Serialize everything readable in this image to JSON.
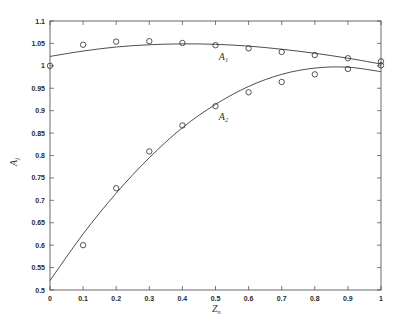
{
  "chart_data": {
    "type": "line",
    "title": "",
    "xlabel": {
      "base": "Z",
      "sub": "n"
    },
    "ylabel": {
      "base": "A",
      "sub": "j"
    },
    "xlim": [
      0,
      1
    ],
    "ylim": [
      0.5,
      1.1
    ],
    "grid": false,
    "legend": null,
    "xticks": [
      0,
      0.1,
      0.2,
      0.3,
      0.4,
      0.5,
      0.6,
      0.7,
      0.8,
      0.9,
      1
    ],
    "xticklabels": [
      "0",
      "0.1",
      "0.2",
      "0.3",
      "0.4",
      "0.5",
      "0.6",
      "0.7",
      "0.8",
      "0.9",
      "1"
    ],
    "yticks": [
      0.5,
      0.55,
      0.6,
      0.65,
      0.7,
      0.75,
      0.8,
      0.85,
      0.9,
      0.95,
      1.0,
      1.05,
      1.1
    ],
    "yticklabels": [
      "0.5",
      "0.55",
      "0.6",
      "0.65",
      "0.7",
      "0.75",
      "0.8",
      "0.85",
      "0.9",
      "0.95",
      "1",
      "1.05",
      "1.1"
    ],
    "series": [
      {
        "name": "A1 (fit)",
        "style": "line",
        "x": [
          0,
          0.1,
          0.2,
          0.3,
          0.4,
          0.5,
          0.6,
          0.7,
          0.8,
          0.9,
          1.0
        ],
        "values": [
          1.021,
          1.033,
          1.042,
          1.047,
          1.049,
          1.048,
          1.044,
          1.037,
          1.028,
          1.017,
          1.004
        ]
      },
      {
        "name": "A1 (data)",
        "style": "marker-circle",
        "x": [
          0,
          0.1,
          0.2,
          0.3,
          0.4,
          0.5,
          0.6,
          0.7,
          0.8,
          0.9,
          1.0
        ],
        "values": [
          1.0,
          1.047,
          1.054,
          1.055,
          1.051,
          1.046,
          1.039,
          1.031,
          1.024,
          1.017,
          1.01
        ]
      },
      {
        "name": "A2 (fit)",
        "style": "line",
        "x": [
          0,
          0.1,
          0.2,
          0.3,
          0.4,
          0.5,
          0.6,
          0.7,
          0.8,
          0.9,
          1.0
        ],
        "values": [
          0.521,
          0.625,
          0.716,
          0.795,
          0.862,
          0.914,
          0.954,
          0.981,
          0.995,
          0.997,
          0.987
        ]
      },
      {
        "name": "A2 (data)",
        "style": "marker-circle",
        "x": [
          0.1,
          0.2,
          0.3,
          0.4,
          0.5,
          0.6,
          0.7,
          0.8,
          0.9,
          1.0
        ],
        "values": [
          0.6,
          0.727,
          0.809,
          0.867,
          0.91,
          0.941,
          0.964,
          0.981,
          0.993,
          1.001
        ]
      }
    ],
    "annotations": [
      {
        "base": "A",
        "sub": "1",
        "x": 0.51,
        "y": 1.02
      },
      {
        "base": "A",
        "sub": "2",
        "x": 0.51,
        "y": 0.886
      }
    ],
    "colors": {
      "line": "#3a3a3a",
      "marker": "#2a2a2a",
      "axis": "#444444"
    }
  }
}
